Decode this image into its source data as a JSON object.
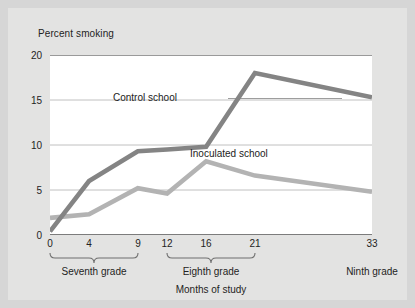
{
  "chart_data": {
    "type": "line",
    "title": "",
    "xlabel": "Months of study",
    "ylabel": "Percent smoking",
    "x": [
      0,
      4,
      9,
      12,
      16,
      21,
      33
    ],
    "xtick_labels": [
      "0",
      "4",
      "9",
      "12",
      "16",
      "21",
      "33"
    ],
    "ytick_labels": [
      "0",
      "5",
      "10",
      "15",
      "20"
    ],
    "yticks": [
      0,
      5,
      10,
      15,
      20
    ],
    "ylim": [
      0,
      20
    ],
    "xlim": [
      0,
      33
    ],
    "grid": "horizontal",
    "legend_position": "inline-annotations",
    "series": [
      {
        "name": "Control school",
        "color": "#848484",
        "values": [
          0.4,
          6.0,
          9.3,
          9.5,
          9.8,
          18.0,
          15.3
        ]
      },
      {
        "name": "Inoculated school",
        "color": "#b3b3b3",
        "values": [
          1.9,
          2.3,
          5.2,
          4.6,
          8.2,
          6.6,
          4.8
        ]
      }
    ],
    "annotations": [
      {
        "name": "control-school-label",
        "text": "Control school"
      },
      {
        "name": "inoculated-school-label",
        "text": "Inoculated school"
      }
    ],
    "grade_groups": [
      {
        "name": "seventh-grade",
        "label": "Seventh grade",
        "from": 0,
        "to": 9,
        "bracket": true
      },
      {
        "name": "eighth-grade",
        "label": "Eighth grade",
        "from": 12,
        "to": 21,
        "bracket": true
      },
      {
        "name": "ninth-grade",
        "label": "Ninth grade",
        "from": 33,
        "to": 33,
        "bracket": false
      }
    ]
  }
}
